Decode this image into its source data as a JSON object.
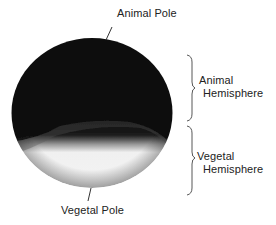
{
  "figure": {
    "labels": {
      "animal_pole": "Animal Pole",
      "vegetal_pole": "Vegetal Pole",
      "animal_hemisphere_line1": "Animal",
      "animal_hemisphere_line2": "Hemisphere",
      "vegetal_hemisphere_line1": "Vegetal",
      "vegetal_hemisphere_line2": "Hemisphere"
    },
    "colors": {
      "animal_hemisphere": "#0d0d0d",
      "vegetal_hemisphere": "#f2f2f2",
      "lines": "#333333",
      "background": "#ffffff"
    }
  }
}
